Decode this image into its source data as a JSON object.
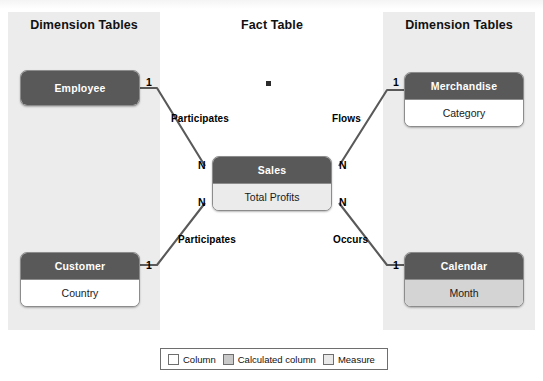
{
  "diagram": {
    "type": "star-schema",
    "columns": {
      "left_title": "Dimension Tables",
      "center_title": "Fact Table",
      "right_title": "Dimension Tables"
    },
    "tables": [
      {
        "id": "employee",
        "name": "Employee",
        "role": "dimension",
        "fields": []
      },
      {
        "id": "customer",
        "name": "Customer",
        "role": "dimension",
        "fields": [
          {
            "name": "Country",
            "kind": "column"
          }
        ]
      },
      {
        "id": "sales",
        "name": "Sales",
        "role": "fact",
        "fields": [
          {
            "name": "Total Profits",
            "kind": "measure"
          }
        ]
      },
      {
        "id": "merchandise",
        "name": "Merchandise",
        "role": "dimension",
        "fields": [
          {
            "name": "Category",
            "kind": "column"
          }
        ]
      },
      {
        "id": "calendar",
        "name": "Calendar",
        "role": "dimension",
        "fields": [
          {
            "name": "Month",
            "kind": "calculated"
          }
        ]
      }
    ],
    "relationships": [
      {
        "id": "employee-sales",
        "from": "Employee",
        "to": "Sales",
        "label": "Participates",
        "from_cardinality": "1",
        "to_cardinality": "N"
      },
      {
        "id": "merchandise-sales",
        "from": "Merchandise",
        "to": "Sales",
        "label": "Flows",
        "from_cardinality": "1",
        "to_cardinality": "N"
      },
      {
        "id": "customer-sales",
        "from": "Customer",
        "to": "Sales",
        "label": "Participates",
        "from_cardinality": "1",
        "to_cardinality": "N"
      },
      {
        "id": "calendar-sales",
        "from": "Calendar",
        "to": "Sales",
        "label": "Occurs",
        "from_cardinality": "1",
        "to_cardinality": "N"
      }
    ],
    "legend": {
      "items": [
        {
          "label": "Column",
          "kind": "column",
          "color": "#ffffff"
        },
        {
          "label": "Calculated column",
          "kind": "calculated",
          "color": "#c9c9c9"
        },
        {
          "label": "Measure",
          "kind": "measure",
          "color": "#e9e9e9"
        }
      ]
    },
    "colors": {
      "panel": "#ececec",
      "header": "#595959",
      "column": "#ffffff",
      "calculated": "#d4d4d4",
      "measure": "#ebebeb",
      "connector": "#595959"
    }
  }
}
